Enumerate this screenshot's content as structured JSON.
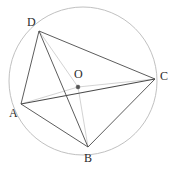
{
  "figure": {
    "name": "cyclic-quadrilateral-abcd",
    "canvas": {
      "width": 174,
      "height": 170,
      "background": "#ffffff"
    },
    "colors": {
      "circle_stroke": "#b9b9b9",
      "chord_stroke": "#4a4a4a",
      "radius_stroke": "#c2c2c2",
      "center_dot": "#555555",
      "label_text": "#2b2b2b"
    },
    "circle": {
      "label": "circumcircle",
      "center": {
        "x": 83,
        "y": 81
      },
      "radius": 74
    },
    "center_point": {
      "label": "O",
      "x": 78,
      "y": 87,
      "label_x": 74,
      "label_y": 68
    },
    "vertices": [
      {
        "id": "A",
        "label": "A",
        "x": 21,
        "y": 104,
        "label_x": 9,
        "label_y": 107
      },
      {
        "id": "B",
        "label": "B",
        "x": 88,
        "y": 147,
        "label_x": 84,
        "label_y": 152
      },
      {
        "id": "C",
        "label": "C",
        "x": 155,
        "y": 79,
        "label_x": 160,
        "label_y": 70
      },
      {
        "id": "D",
        "label": "D",
        "x": 39,
        "y": 31,
        "label_x": 27,
        "label_y": 16
      }
    ],
    "chords": [
      {
        "name": "segment-DA",
        "from": "D",
        "to": "A",
        "x1": 39,
        "y1": 31,
        "x2": 21,
        "y2": 104
      },
      {
        "name": "segment-DB",
        "from": "D",
        "to": "B",
        "x1": 39,
        "y1": 31,
        "x2": 88,
        "y2": 147
      },
      {
        "name": "segment-DC",
        "from": "D",
        "to": "C",
        "x1": 39,
        "y1": 31,
        "x2": 155,
        "y2": 79
      },
      {
        "name": "segment-AB",
        "from": "A",
        "to": "B",
        "x1": 21,
        "y1": 104,
        "x2": 88,
        "y2": 147
      },
      {
        "name": "segment-AC",
        "from": "A",
        "to": "C",
        "x1": 21,
        "y1": 104,
        "x2": 155,
        "y2": 79
      },
      {
        "name": "segment-BC",
        "from": "B",
        "to": "C",
        "x1": 88,
        "y1": 147,
        "x2": 155,
        "y2": 79
      }
    ],
    "radii": [
      {
        "name": "radius-OD",
        "from": "O",
        "to": "D",
        "x1": 78,
        "y1": 87,
        "x2": 39,
        "y2": 31
      },
      {
        "name": "radius-OB",
        "from": "O",
        "to": "B",
        "x1": 78,
        "y1": 87,
        "x2": 88,
        "y2": 147
      },
      {
        "name": "radius-OC",
        "from": "O",
        "to": "C",
        "x1": 78,
        "y1": 87,
        "x2": 155,
        "y2": 79
      },
      {
        "name": "radius-OA",
        "from": "O",
        "to": "A",
        "x1": 78,
        "y1": 87,
        "x2": 21,
        "y2": 104
      }
    ]
  }
}
